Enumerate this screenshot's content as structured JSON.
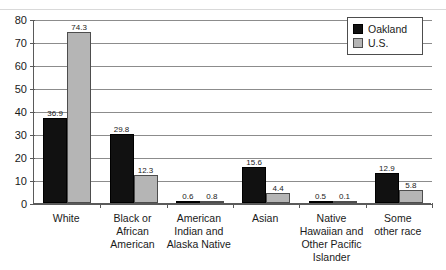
{
  "chart_data": {
    "type": "bar",
    "title": "",
    "subtitle": "",
    "xlabel": "",
    "ylabel": "",
    "ylim": [
      0,
      80
    ],
    "yticks": [
      0,
      10,
      20,
      30,
      40,
      50,
      60,
      70,
      80
    ],
    "ytick_labels": [
      "0",
      "10",
      "20",
      "30",
      "40",
      "50",
      "60",
      "70",
      "80"
    ],
    "grid": "horizontal",
    "legend_position": "top-right",
    "categories": [
      "White",
      "Black or African American",
      "American Indian and Alaska Native",
      "Asian",
      "Native Hawaiian and Other Pacific Islander",
      "Some other race"
    ],
    "category_label_lines": [
      [
        "White"
      ],
      [
        "Black or",
        "African",
        "American"
      ],
      [
        "American",
        "Indian and",
        "Alaska Native"
      ],
      [
        "Asian"
      ],
      [
        "Native",
        "Hawaiian and",
        "Other Pacific",
        "Islander"
      ],
      [
        "Some",
        "other race"
      ]
    ],
    "series": [
      {
        "name": "Oakland",
        "color": "#111111",
        "values": [
          36.9,
          29.8,
          0.6,
          15.6,
          0.5,
          12.9
        ],
        "value_labels": [
          "36.9",
          "29.8",
          "0.6",
          "15.6",
          "0.5",
          "12.9"
        ]
      },
      {
        "name": "U.S.",
        "color": "#b5b5b5",
        "values": [
          74.3,
          12.3,
          0.8,
          4.4,
          0.1,
          5.8
        ],
        "value_labels": [
          "74.3",
          "12.3",
          "0.8",
          "4.4",
          "0.1",
          "5.8"
        ]
      }
    ]
  },
  "legend": {
    "items": [
      {
        "label": "Oakland",
        "swatch": "oakland"
      },
      {
        "label": "U.S.",
        "swatch": "us"
      }
    ]
  }
}
